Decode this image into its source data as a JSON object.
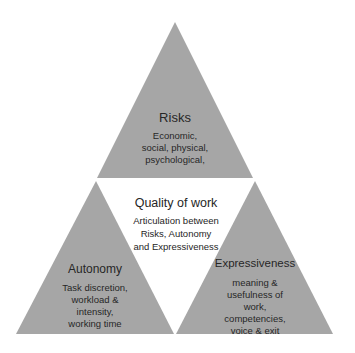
{
  "diagram": {
    "fill_color": "#a6a6a6",
    "text_color": "#262626",
    "center": {
      "title": "Quality of work",
      "lines": [
        "Articulation between",
        "Risks, Autonomy",
        "and Expressiveness"
      ]
    },
    "triangles": [
      {
        "id": "risks",
        "title": "Risks",
        "lines": [
          "Economic,",
          "social, physical,",
          "psychological,"
        ]
      },
      {
        "id": "autonomy",
        "title": "Autonomy",
        "lines": [
          "Task discretion,",
          "workload &",
          "intensity,",
          "working time"
        ]
      },
      {
        "id": "expressiveness",
        "title": "Expressiveness",
        "lines": [
          "meaning &",
          "usefulness of",
          "work,",
          "competencies,",
          "voice & exit"
        ]
      }
    ]
  }
}
